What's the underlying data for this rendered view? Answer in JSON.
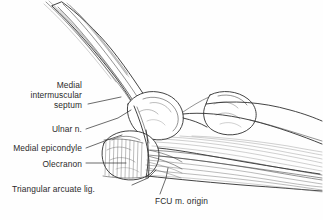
{
  "figure": {
    "background_color": "#fefefe",
    "ink_color": "#2b2b2b",
    "width": 323,
    "height": 220
  },
  "labels": {
    "medial_intermuscular_septum": "Medial\nintermuscular\nseptum",
    "medial_intermuscular_septum_line1": "Medial",
    "medial_intermuscular_septum_line2": "intermuscular",
    "medial_intermuscular_septum_line3": "septum",
    "ulnar_nerve": "Ulnar n.",
    "medial_epicondyle": "Medial epicondyle",
    "olecranon": "Olecranon",
    "triangular_arcuate_ligament": "Triangular arcuate lig.",
    "fcu_muscle_origin": "FCU m. origin"
  }
}
